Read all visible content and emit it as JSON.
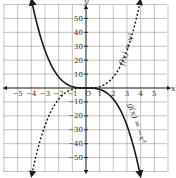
{
  "chart_data": {
    "type": "line",
    "title": "",
    "xlabel": "x",
    "ylabel": "y",
    "xlim": [
      -6,
      6
    ],
    "ylim": [
      -60,
      60
    ],
    "grid": true,
    "x_ticks": [
      -5,
      -4,
      -3,
      -2,
      -1,
      0,
      1,
      2,
      3,
      4,
      5
    ],
    "x_tick_labels": [
      "−5",
      "−4",
      "−3",
      "−2",
      "−1",
      "O",
      "1",
      "2",
      "3",
      "4",
      "5"
    ],
    "y_ticks": [
      -50,
      -40,
      -30,
      -20,
      -10,
      10,
      20,
      30,
      40,
      50
    ],
    "y_tick_labels": [
      "−50",
      "−40",
      "−30",
      "−20",
      "−10",
      "10",
      "20",
      "30",
      "40",
      "50"
    ],
    "series": [
      {
        "name": "f(x) = x³",
        "style": "dashed",
        "expression": "x^3",
        "x": [
          -4,
          -3,
          -2,
          -1,
          0,
          1,
          2,
          3,
          4
        ],
        "values": [
          -64,
          -27,
          -8,
          -1,
          0,
          1,
          8,
          27,
          64
        ]
      },
      {
        "name": "g(x) = −x³",
        "style": "solid",
        "expression": "-x^3",
        "x": [
          -4,
          -3,
          -2,
          -1,
          0,
          1,
          2,
          3,
          4
        ],
        "values": [
          64,
          27,
          8,
          1,
          0,
          -1,
          -8,
          -27,
          -64
        ]
      }
    ],
    "annotations": [
      {
        "text": "f(x) = x³",
        "near": "dashed curve, upper right"
      },
      {
        "text": "g(x) = −x³",
        "near": "solid curve, lower right"
      }
    ]
  },
  "labels": {
    "x_axis": "x",
    "y_axis": "y",
    "origin": "O",
    "f_label": "f(x) = x³",
    "g_label": "g(x) = −x³"
  }
}
